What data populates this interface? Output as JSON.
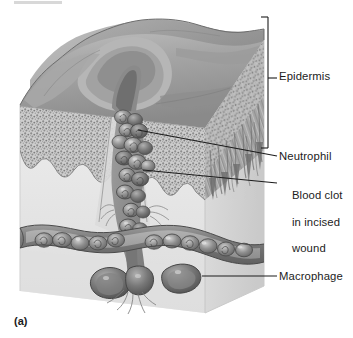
{
  "figure": {
    "caption_marker": "(a)",
    "style": "grayscale textbook line-and-tone illustration",
    "background_color": "#ffffff",
    "ink_color": "#1c1c1c"
  },
  "labels": [
    {
      "id": "epidermis",
      "text": "Epidermis",
      "connector": "bracket",
      "bracket": {
        "x": 266,
        "y_top": 17,
        "y_bottom": 148,
        "tick_y": 78,
        "tick_x_end": 277
      }
    },
    {
      "id": "neutrophil",
      "text": "Neutrophil",
      "connector": "leader-line",
      "leader": {
        "x1": 139,
        "y1": 130,
        "x2": 277,
        "y2": 156
      }
    },
    {
      "id": "blood-clot",
      "text": "Blood clot\nin incised\nwound",
      "line1": "Blood clot",
      "line2": "in incised",
      "line3": "wound",
      "connector": "leader-line",
      "leader": {
        "x1": 143,
        "y1": 170,
        "x2": 277,
        "y2": 182
      }
    },
    {
      "id": "macrophage",
      "text": "Macrophage",
      "connector": "leader-line",
      "leader": {
        "x1": 205,
        "y1": 276,
        "x2": 277,
        "y2": 276
      }
    }
  ],
  "illustration_parts": {
    "block_top_surface": "undulating skin surface with wound fissure",
    "block_front_face": "cross-section showing stippled epidermis with rete ridges",
    "block_right_face": "fibrous collagen / dermal texture",
    "clot_column": "column of clustered blood cells descending from wound into dermis",
    "blood_vessel": "horizontal vessel in cross-section filled with erythrocytes",
    "macrophages": "two large ameboid cells below the vessel",
    "colors": {
      "surface_light": "#b9b9b9",
      "surface_mid": "#9a9a9a",
      "surface_dark": "#6e6e6e",
      "dermis_pale": "#e3e3e3",
      "dermis_shadow": "#cfcfcf",
      "cell_fill": "#8d8d8d",
      "cell_dark": "#5d5d5d",
      "cell_highlight": "#d9d9d9",
      "stipple": "#8a8a8a",
      "outline": "#4a4a4a"
    }
  }
}
